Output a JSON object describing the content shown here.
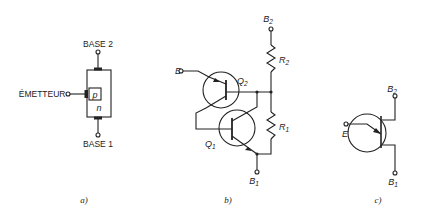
{
  "figure": {
    "panel_a": {
      "caption": "a)",
      "labels": {
        "base2": "BASE 2",
        "base1": "BASE 1",
        "emitter": "ÉMETTEUR",
        "p_region": "p",
        "n_region": "n"
      }
    },
    "panel_b": {
      "caption": "b)",
      "labels": {
        "e": "E",
        "b2": "B",
        "b2_sub": "2",
        "b1": "B",
        "b1_sub": "1",
        "q2": "Q",
        "q2_sub": "2",
        "q1": "Q",
        "q1_sub": "1",
        "r2": "R",
        "r2_sub": "2",
        "r1": "R",
        "r1_sub": "1"
      }
    },
    "panel_c": {
      "caption": "c)",
      "labels": {
        "e": "E",
        "b2": "B",
        "b2_sub": "2",
        "b1": "B",
        "b1_sub": "1"
      }
    }
  }
}
